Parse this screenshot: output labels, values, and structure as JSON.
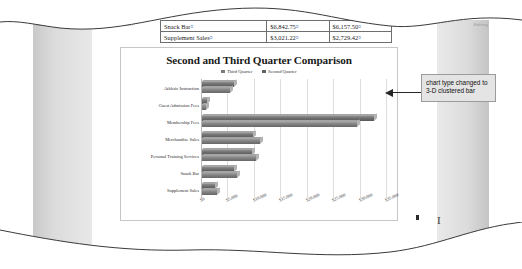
{
  "document": {
    "ribbon_labels": [
      "Home",
      "Insert",
      "Paragraph",
      "Styles",
      "Editing"
    ],
    "table": {
      "rows": [
        {
          "label": "Snack Bar",
          "second_quarter": "$6,842.75",
          "third_quarter": "$6,157.50"
        },
        {
          "label": "Supplement Sales",
          "second_quarter": "$3,021.22",
          "third_quarter": "$2,729.42"
        }
      ],
      "paragraph_mark": "¤",
      "cell_mark": "¤"
    }
  },
  "callout": {
    "text": "chart type changed to 3-D clustered bar",
    "arrow_icon": "left-arrow-icon"
  },
  "chart_data": {
    "type": "bar",
    "orientation": "horizontal",
    "style": "3-D clustered bar",
    "title": "Second and Third Quarter Comparison",
    "xlabel": "",
    "ylabel": "",
    "grid": true,
    "legend_position": "top",
    "xlim": [
      0,
      35000
    ],
    "xticks": [
      0,
      5000,
      10000,
      15000,
      20000,
      25000,
      30000,
      35000
    ],
    "xtick_labels": [
      "$0",
      "$5,000",
      "$10,000",
      "$15,000",
      "$20,000",
      "$25,000",
      "$30,000",
      "$35,000"
    ],
    "categories": [
      "Athletic Instruction",
      "Guest Admission Fees",
      "Membership Fees",
      "Merchandise Sales",
      "Personal Training Services",
      "Snack Bar",
      "Supplement Sales"
    ],
    "series": [
      {
        "name": "Third Quarter",
        "color": "#7a7a7a",
        "values": [
          6250,
          1100,
          32800,
          9900,
          9600,
          6157,
          2729
        ]
      },
      {
        "name": "Second Quarter",
        "color": "#626262",
        "values": [
          5400,
          950,
          29600,
          11200,
          10400,
          6843,
          3021
        ]
      }
    ]
  }
}
